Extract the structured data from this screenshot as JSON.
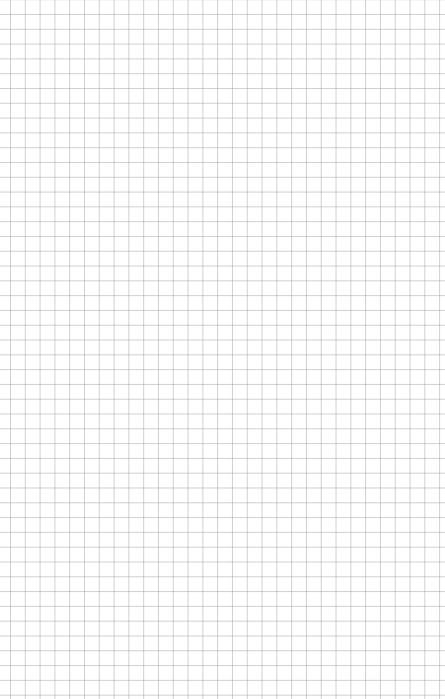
{
  "canvas": {
    "type": "grid-paper",
    "background_color": "#ffffff",
    "line_color": "#969696",
    "cell_size_px": 14.8,
    "offset_x_px": 10,
    "offset_y_px": 14
  }
}
